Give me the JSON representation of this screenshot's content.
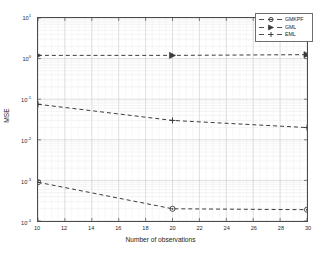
{
  "chart_data": {
    "type": "line",
    "title": "",
    "xlabel": "Number of observations",
    "ylabel": "MSE",
    "xscale": "linear",
    "yscale": "log",
    "xlim": [
      10,
      30
    ],
    "ylim": [
      0.0001,
      10
    ],
    "grid": true,
    "legend_position": "top-right",
    "x": [
      10,
      20,
      30
    ],
    "xticks": [
      "10",
      "12",
      "14",
      "16",
      "18",
      "20",
      "22",
      "24",
      "26",
      "28",
      "30"
    ],
    "xtick_values": [
      10,
      12,
      14,
      16,
      18,
      20,
      22,
      24,
      26,
      28,
      30
    ],
    "yticks": [
      "10",
      "10",
      "10",
      "10",
      "10",
      "10"
    ],
    "ytick_exponents": [
      "1",
      "0",
      "-1",
      "-2",
      "-3",
      "-4"
    ],
    "ytick_values": [
      10,
      1,
      0.1,
      0.01,
      0.001,
      0.0001
    ],
    "series": [
      {
        "name": "GMKPF",
        "marker": "circle",
        "linestyle": "dashed",
        "color": "#3a3a3a",
        "values": [
          0.0009,
          0.0002,
          0.00019
        ]
      },
      {
        "name": "GML",
        "marker": "right-triangle",
        "linestyle": "dashed",
        "color": "#3a3a3a",
        "values": [
          1.2,
          1.2,
          1.25
        ]
      },
      {
        "name": "EML",
        "marker": "plus",
        "linestyle": "dashed",
        "color": "#3a3a3a",
        "values": [
          0.075,
          0.03,
          0.02
        ]
      }
    ]
  },
  "legend": {
    "entries": [
      {
        "label": "GMKPF"
      },
      {
        "label": "GML"
      },
      {
        "label": "EML"
      }
    ]
  },
  "axes": {
    "x_title": "Number of observations",
    "y_title": "MSE",
    "y_base": "10"
  }
}
